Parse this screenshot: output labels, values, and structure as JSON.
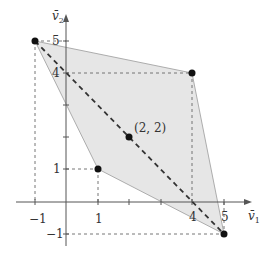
{
  "diagram": {
    "axes": {
      "x_label": "v̄",
      "x_label_sub": "1",
      "y_label": "v̄",
      "y_label_sub": "2",
      "x_ticks": [
        {
          "value": -1,
          "label": "−1"
        },
        {
          "value": 1,
          "label": "1"
        },
        {
          "value": 2,
          "label": ""
        },
        {
          "value": 3,
          "label": ""
        },
        {
          "value": 4,
          "label": "4"
        },
        {
          "value": 5,
          "label": "5"
        }
      ],
      "y_ticks": [
        {
          "value": -1,
          "label": "−1"
        },
        {
          "value": 1,
          "label": "1"
        },
        {
          "value": 2,
          "label": ""
        },
        {
          "value": 3,
          "label": ""
        },
        {
          "value": 4,
          "label": "4"
        },
        {
          "value": 5,
          "label": "5"
        }
      ]
    },
    "polygon": {
      "vertices": [
        [
          -1,
          5
        ],
        [
          4,
          4
        ],
        [
          5,
          -1
        ],
        [
          1,
          1
        ]
      ],
      "fill": "#e6e6e6",
      "stroke": "#9a9a9a"
    },
    "points": [
      {
        "x": -1,
        "y": 5
      },
      {
        "x": 4,
        "y": 4
      },
      {
        "x": 1,
        "y": 1
      },
      {
        "x": 5,
        "y": -1
      },
      {
        "x": 2,
        "y": 2,
        "label": "(2, 2)"
      }
    ],
    "dashed_line": {
      "from": [
        -1,
        5
      ],
      "to": [
        5,
        -1
      ]
    },
    "center_label": "(2, 2)",
    "colors": {
      "axis": "#555555",
      "point": "#111111",
      "guide": "#666666",
      "diagonal": "#333333"
    }
  }
}
